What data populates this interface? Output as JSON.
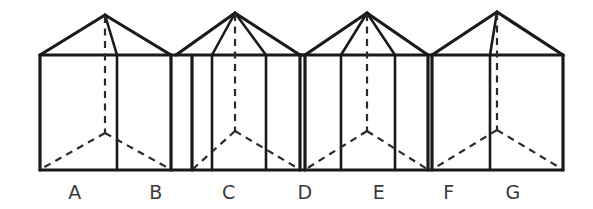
{
  "figure": {
    "background_color": "#ffffff",
    "line_color": "#1a1a1a",
    "hidden_line_color": "#2a2a2a",
    "label_color": "#3a3a3a",
    "baseline_y": 170,
    "eaves_y": 53,
    "labels": [
      {
        "id": "label-a",
        "text": "A",
        "x": 75,
        "y": 199
      },
      {
        "id": "label-b",
        "text": "B",
        "x": 156,
        "y": 199
      },
      {
        "id": "label-c",
        "text": "C",
        "x": 229,
        "y": 199
      },
      {
        "id": "label-d",
        "text": "D",
        "x": 305,
        "y": 199
      },
      {
        "id": "label-e",
        "text": "E",
        "x": 379,
        "y": 199
      },
      {
        "id": "label-f",
        "text": "F",
        "x": 449,
        "y": 199
      },
      {
        "id": "label-g",
        "text": "G",
        "x": 513,
        "y": 199
      }
    ],
    "houses": [
      {
        "name": "house-1",
        "apex_x": 105,
        "apex_y": 15,
        "left_wall_x": 40,
        "ridge_x": 117,
        "right_wall_x": 171,
        "eave_left_x": 40,
        "eave_right_x": 171,
        "center_dash_x": 105
      },
      {
        "name": "house-2",
        "apex_x": 235,
        "apex_y": 13,
        "left_wall_x": 192,
        "ridge_x": 212,
        "right_wall_x": 266,
        "eave_left_x": 176,
        "eave_right_x": 300,
        "center_dash_x": 235
      },
      {
        "name": "house-3",
        "apex_x": 367,
        "apex_y": 13,
        "left_wall_x": 305,
        "ridge_x": 341,
        "right_wall_x": 395,
        "eave_left_x": 305,
        "eave_right_x": 428,
        "center_dash_x": 367
      },
      {
        "name": "house-4",
        "apex_x": 497,
        "apex_y": 12,
        "left_wall_x": 432,
        "ridge_x": 490,
        "right_wall_x": 563,
        "eave_left_x": 432,
        "eave_right_x": 563,
        "center_dash_x": 497
      }
    ]
  }
}
